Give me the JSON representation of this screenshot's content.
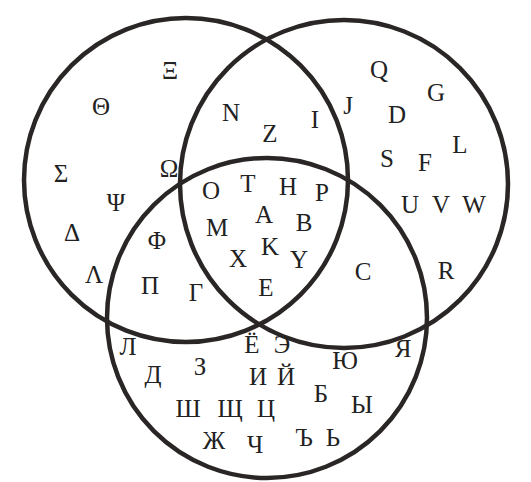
{
  "diagram": {
    "type": "venn-3",
    "stroke_color": "#2b2626",
    "text_color": "#222222",
    "background": "#ffffff",
    "circles": [
      {
        "id": "left",
        "cx": 186,
        "cy": 180,
        "r": 162
      },
      {
        "id": "right",
        "cx": 344,
        "cy": 184,
        "r": 164
      },
      {
        "id": "bottom",
        "cx": 267,
        "cy": 318,
        "r": 160
      }
    ],
    "regions": {
      "left_only": {
        "label": "Greek only",
        "letters": [
          {
            "ch": "Ξ",
            "x": 170,
            "y": 70
          },
          {
            "ch": "Θ",
            "x": 101,
            "y": 106
          },
          {
            "ch": "Σ",
            "x": 61,
            "y": 173
          },
          {
            "ch": "Ω",
            "x": 169,
            "y": 168
          },
          {
            "ch": "Ψ",
            "x": 116,
            "y": 202
          },
          {
            "ch": "Δ",
            "x": 72,
            "y": 232
          },
          {
            "ch": "Λ",
            "x": 94,
            "y": 274
          }
        ]
      },
      "right_only": {
        "label": "Latin only",
        "letters": [
          {
            "ch": "Q",
            "x": 379,
            "y": 69
          },
          {
            "ch": "G",
            "x": 436,
            "y": 92
          },
          {
            "ch": "J",
            "x": 348,
            "y": 105
          },
          {
            "ch": "D",
            "x": 397,
            "y": 114
          },
          {
            "ch": "L",
            "x": 460,
            "y": 144
          },
          {
            "ch": "S",
            "x": 387,
            "y": 158
          },
          {
            "ch": "F",
            "x": 425,
            "y": 162
          },
          {
            "ch": "U",
            "x": 410,
            "y": 204
          },
          {
            "ch": "V",
            "x": 441,
            "y": 204
          },
          {
            "ch": "W",
            "x": 474,
            "y": 204
          },
          {
            "ch": "R",
            "x": 446,
            "y": 270
          }
        ]
      },
      "bottom_only": {
        "label": "Cyrillic only",
        "letters": [
          {
            "ch": "Л",
            "x": 128,
            "y": 346
          },
          {
            "ch": "Д",
            "x": 153,
            "y": 374
          },
          {
            "ch": "З",
            "x": 200,
            "y": 366
          },
          {
            "ch": "Ш",
            "x": 188,
            "y": 408
          },
          {
            "ch": "Щ",
            "x": 230,
            "y": 408
          },
          {
            "ch": "Ж",
            "x": 214,
            "y": 440
          },
          {
            "ch": "Ч",
            "x": 255,
            "y": 444
          },
          {
            "ch": "И",
            "x": 258,
            "y": 376
          },
          {
            "ch": "Й",
            "x": 286,
            "y": 376
          },
          {
            "ch": "Ц",
            "x": 266,
            "y": 408
          },
          {
            "ch": "Э",
            "x": 282,
            "y": 344
          },
          {
            "ch": "Ю",
            "x": 345,
            "y": 360
          },
          {
            "ch": "Я",
            "x": 403,
            "y": 348
          },
          {
            "ch": "Б",
            "x": 321,
            "y": 393
          },
          {
            "ch": "Ы",
            "x": 362,
            "y": 404
          },
          {
            "ch": "Ъ",
            "x": 304,
            "y": 437
          },
          {
            "ch": "Ь",
            "x": 333,
            "y": 437
          }
        ]
      },
      "left_right": {
        "label": "Greek ∩ Latin",
        "letters": [
          {
            "ch": "N",
            "x": 231,
            "y": 112
          },
          {
            "ch": "Z",
            "x": 270,
            "y": 133
          },
          {
            "ch": "I",
            "x": 315,
            "y": 119
          }
        ]
      },
      "left_bottom": {
        "label": "Greek ∩ Cyrillic",
        "letters": [
          {
            "ch": "Φ",
            "x": 157,
            "y": 240
          },
          {
            "ch": "Π",
            "x": 150,
            "y": 285
          },
          {
            "ch": "Γ",
            "x": 196,
            "y": 292
          }
        ]
      },
      "right_bottom": {
        "label": "Latin ∩ Cyrillic",
        "letters": [
          {
            "ch": "C",
            "x": 363,
            "y": 271
          }
        ]
      },
      "all_three": {
        "label": "Greek ∩ Latin ∩ Cyrillic",
        "letters": [
          {
            "ch": "O",
            "x": 211,
            "y": 190
          },
          {
            "ch": "T",
            "x": 248,
            "y": 183
          },
          {
            "ch": "H",
            "x": 288,
            "y": 186
          },
          {
            "ch": "P",
            "x": 322,
            "y": 192
          },
          {
            "ch": "M",
            "x": 217,
            "y": 227
          },
          {
            "ch": "A",
            "x": 264,
            "y": 214
          },
          {
            "ch": "B",
            "x": 304,
            "y": 222
          },
          {
            "ch": "K",
            "x": 270,
            "y": 246
          },
          {
            "ch": "X",
            "x": 238,
            "y": 258
          },
          {
            "ch": "Y",
            "x": 299,
            "y": 259
          },
          {
            "ch": "E",
            "x": 266,
            "y": 287
          },
          {
            "ch": "Ё",
            "x": 252,
            "y": 344
          }
        ]
      }
    }
  }
}
